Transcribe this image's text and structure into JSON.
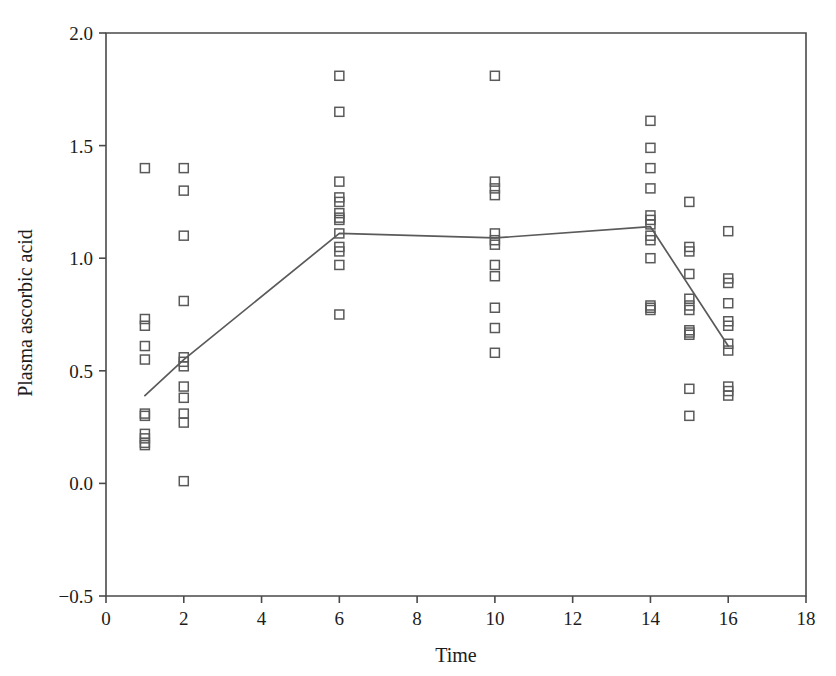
{
  "chart_data": {
    "type": "scatter",
    "title": "",
    "xlabel": "Time",
    "ylabel": "Plasma ascorbic acid",
    "xlim": [
      0,
      18
    ],
    "ylim": [
      -0.5,
      2.0
    ],
    "xticks": [
      0,
      2,
      4,
      6,
      8,
      10,
      12,
      14,
      16,
      18
    ],
    "xtick_labels": [
      "0",
      "2",
      "4",
      "6",
      "8",
      "10",
      "12",
      "14",
      "16",
      "18"
    ],
    "yticks": [
      -0.5,
      0.0,
      0.5,
      1.0,
      1.5,
      2.0
    ],
    "ytick_labels": [
      "−0.5",
      "0.0",
      "0.5",
      "1.0",
      "1.5",
      "2.0"
    ],
    "grid": false,
    "legend": null,
    "marker": "open-square",
    "marker_color": "#5a5a5a",
    "line_color": "#5a5a5a",
    "series": [
      {
        "name": "Individual observations",
        "type": "scatter",
        "points": [
          {
            "x": 1,
            "y": 1.4
          },
          {
            "x": 1,
            "y": 0.73
          },
          {
            "x": 1,
            "y": 0.7
          },
          {
            "x": 1,
            "y": 0.61
          },
          {
            "x": 1,
            "y": 0.55
          },
          {
            "x": 1,
            "y": 0.31
          },
          {
            "x": 1,
            "y": 0.3
          },
          {
            "x": 1,
            "y": 0.22
          },
          {
            "x": 1,
            "y": 0.2
          },
          {
            "x": 1,
            "y": 0.18
          },
          {
            "x": 1,
            "y": 0.17
          },
          {
            "x": 2,
            "y": 1.4
          },
          {
            "x": 2,
            "y": 1.3
          },
          {
            "x": 2,
            "y": 1.1
          },
          {
            "x": 2,
            "y": 0.81
          },
          {
            "x": 2,
            "y": 0.56
          },
          {
            "x": 2,
            "y": 0.54
          },
          {
            "x": 2,
            "y": 0.52
          },
          {
            "x": 2,
            "y": 0.43
          },
          {
            "x": 2,
            "y": 0.38
          },
          {
            "x": 2,
            "y": 0.31
          },
          {
            "x": 2,
            "y": 0.27
          },
          {
            "x": 2,
            "y": 0.01
          },
          {
            "x": 6,
            "y": 1.81
          },
          {
            "x": 6,
            "y": 1.65
          },
          {
            "x": 6,
            "y": 1.34
          },
          {
            "x": 6,
            "y": 1.27
          },
          {
            "x": 6,
            "y": 1.25
          },
          {
            "x": 6,
            "y": 1.2
          },
          {
            "x": 6,
            "y": 1.18
          },
          {
            "x": 6,
            "y": 1.17
          },
          {
            "x": 6,
            "y": 1.11
          },
          {
            "x": 6,
            "y": 1.05
          },
          {
            "x": 6,
            "y": 1.03
          },
          {
            "x": 6,
            "y": 0.97
          },
          {
            "x": 6,
            "y": 0.75
          },
          {
            "x": 10,
            "y": 1.81
          },
          {
            "x": 10,
            "y": 1.34
          },
          {
            "x": 10,
            "y": 1.31
          },
          {
            "x": 10,
            "y": 1.28
          },
          {
            "x": 10,
            "y": 1.11
          },
          {
            "x": 10,
            "y": 1.08
          },
          {
            "x": 10,
            "y": 1.06
          },
          {
            "x": 10,
            "y": 0.97
          },
          {
            "x": 10,
            "y": 0.92
          },
          {
            "x": 10,
            "y": 0.78
          },
          {
            "x": 10,
            "y": 0.69
          },
          {
            "x": 10,
            "y": 0.58
          },
          {
            "x": 14,
            "y": 1.61
          },
          {
            "x": 14,
            "y": 1.49
          },
          {
            "x": 14,
            "y": 1.4
          },
          {
            "x": 14,
            "y": 1.31
          },
          {
            "x": 14,
            "y": 1.19
          },
          {
            "x": 14,
            "y": 1.17
          },
          {
            "x": 14,
            "y": 1.15
          },
          {
            "x": 14,
            "y": 1.1
          },
          {
            "x": 14,
            "y": 1.08
          },
          {
            "x": 14,
            "y": 1.0
          },
          {
            "x": 14,
            "y": 0.79
          },
          {
            "x": 14,
            "y": 0.78
          },
          {
            "x": 14,
            "y": 0.77
          },
          {
            "x": 15,
            "y": 1.25
          },
          {
            "x": 15,
            "y": 1.05
          },
          {
            "x": 15,
            "y": 1.03
          },
          {
            "x": 15,
            "y": 0.93
          },
          {
            "x": 15,
            "y": 0.82
          },
          {
            "x": 15,
            "y": 0.79
          },
          {
            "x": 15,
            "y": 0.77
          },
          {
            "x": 15,
            "y": 0.68
          },
          {
            "x": 15,
            "y": 0.67
          },
          {
            "x": 15,
            "y": 0.66
          },
          {
            "x": 15,
            "y": 0.42
          },
          {
            "x": 15,
            "y": 0.3
          },
          {
            "x": 16,
            "y": 1.12
          },
          {
            "x": 16,
            "y": 0.91
          },
          {
            "x": 16,
            "y": 0.89
          },
          {
            "x": 16,
            "y": 0.8
          },
          {
            "x": 16,
            "y": 0.72
          },
          {
            "x": 16,
            "y": 0.7
          },
          {
            "x": 16,
            "y": 0.62
          },
          {
            "x": 16,
            "y": 0.59
          },
          {
            "x": 16,
            "y": 0.43
          },
          {
            "x": 16,
            "y": 0.41
          },
          {
            "x": 16,
            "y": 0.39
          }
        ]
      },
      {
        "name": "Mean trend",
        "type": "line",
        "x": [
          1,
          2,
          6,
          10,
          14,
          16
        ],
        "values": [
          0.39,
          0.55,
          1.11,
          1.09,
          1.14,
          0.61
        ]
      }
    ]
  }
}
